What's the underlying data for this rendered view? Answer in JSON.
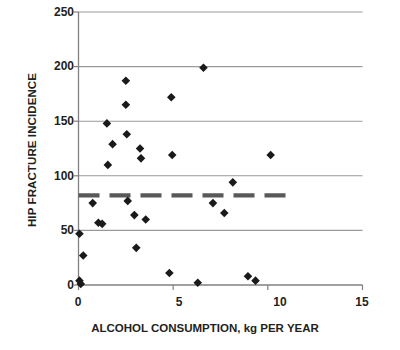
{
  "chart_data": {
    "type": "scatter",
    "title": "",
    "xlabel": "ALCOHOL CONSUMPTION, kg PER YEAR",
    "ylabel": "HIP FRACTURE INCIDENCE",
    "xlim": [
      0,
      15
    ],
    "ylim": [
      0,
      250
    ],
    "xticks": [
      0,
      5,
      10,
      15
    ],
    "xtick_labels": [
      "0",
      "5",
      "10",
      "15"
    ],
    "yticks": [
      0,
      50,
      100,
      150,
      200,
      250
    ],
    "ytick_labels": [
      "0",
      "50",
      "100",
      "150",
      "200",
      "250"
    ],
    "grid": "horizontal",
    "legend": "none",
    "marker": "diamond",
    "marker_color": "#1a1a1a",
    "points": [
      {
        "x": 0.05,
        "y": 47
      },
      {
        "x": 0.05,
        "y": 4
      },
      {
        "x": 0.12,
        "y": 1
      },
      {
        "x": 0.25,
        "y": 27
      },
      {
        "x": 0.75,
        "y": 75
      },
      {
        "x": 1.05,
        "y": 57
      },
      {
        "x": 1.25,
        "y": 56
      },
      {
        "x": 1.5,
        "y": 148
      },
      {
        "x": 1.55,
        "y": 110
      },
      {
        "x": 1.8,
        "y": 129
      },
      {
        "x": 2.5,
        "y": 187
      },
      {
        "x": 2.5,
        "y": 165
      },
      {
        "x": 2.55,
        "y": 138
      },
      {
        "x": 2.6,
        "y": 77
      },
      {
        "x": 2.95,
        "y": 64
      },
      {
        "x": 3.05,
        "y": 34
      },
      {
        "x": 3.25,
        "y": 125
      },
      {
        "x": 3.3,
        "y": 116
      },
      {
        "x": 3.55,
        "y": 60
      },
      {
        "x": 4.8,
        "y": 11
      },
      {
        "x": 4.9,
        "y": 172
      },
      {
        "x": 4.95,
        "y": 119
      },
      {
        "x": 6.3,
        "y": 2
      },
      {
        "x": 6.6,
        "y": 199
      },
      {
        "x": 7.1,
        "y": 75
      },
      {
        "x": 7.7,
        "y": 66
      },
      {
        "x": 8.15,
        "y": 94
      },
      {
        "x": 8.95,
        "y": 8
      },
      {
        "x": 9.35,
        "y": 4
      },
      {
        "x": 10.15,
        "y": 119
      }
    ],
    "trend_line": {
      "style": "dashed",
      "color": "#5a5a5a",
      "value": 82,
      "x_start": 0.0,
      "x_end": 11.0,
      "description": "Horizontal dashed reference line at approximately 82"
    },
    "colors": {
      "axis": "#808080",
      "gridline": "#9a9a9a",
      "text": "#231f20",
      "marker": "#1a1a1a",
      "trend": "#595959",
      "background": "#ffffff"
    }
  }
}
